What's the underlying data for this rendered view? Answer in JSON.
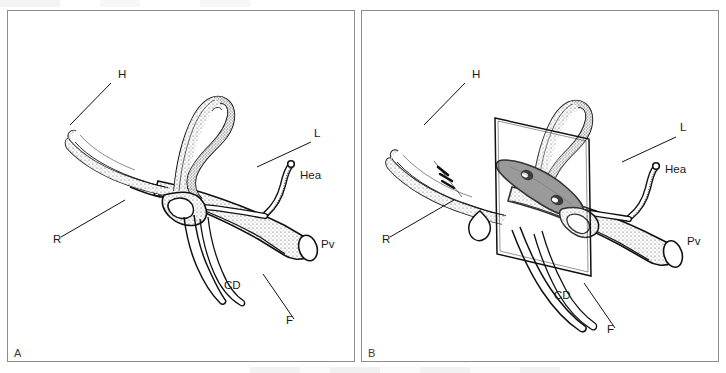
{
  "figure": {
    "background_color": "#ffffff",
    "frame_color": "#8d8d8d",
    "ink_color": "#111111",
    "panel_count": 2
  },
  "panels": [
    {
      "id": "A",
      "letter": "A",
      "caption": "",
      "has_cut_plane": false,
      "labels": [
        {
          "key": "H",
          "text": "H",
          "meaning": "hepatic duct",
          "x": 110,
          "y": 67,
          "leader": [
            [
              103,
              72
            ],
            [
              62,
              114
            ]
          ]
        },
        {
          "key": "L",
          "text": "L",
          "meaning": "left hepatic duct",
          "x": 306,
          "y": 126,
          "leader": [
            [
              303,
              131
            ],
            [
              249,
              156
            ]
          ]
        },
        {
          "key": "Hea",
          "text": "Hea",
          "meaning": "hepatic artery",
          "x": 292,
          "y": 168,
          "leader": []
        },
        {
          "key": "Pv",
          "text": "Pv",
          "meaning": "portal vein",
          "x": 313,
          "y": 237,
          "leader": []
        },
        {
          "key": "R",
          "text": "R",
          "meaning": "right hepatic duct",
          "x": 45,
          "y": 232,
          "leader": [
            [
              53,
              226
            ],
            [
              117,
              189
            ]
          ]
        },
        {
          "key": "CD",
          "text": "CD",
          "meaning": "cystic duct",
          "x": 216,
          "y": 278,
          "leader": []
        },
        {
          "key": "F",
          "text": "F",
          "meaning": "fissure / plate",
          "x": 278,
          "y": 313,
          "leader": [
            [
              286,
              308
            ],
            [
              255,
              263
            ]
          ]
        }
      ]
    },
    {
      "id": "B",
      "letter": "B",
      "caption": "",
      "has_cut_plane": true,
      "cut_plane": {
        "name": "sectioning-plane",
        "fill": "rgba(255,255,255,0.0)",
        "stroke": "#111111",
        "cut_surface_fill": "#8a8a8a",
        "lumen_fill": "#1a1a1a",
        "lumen_count": 2
      },
      "labels": [
        {
          "key": "H",
          "text": "H",
          "meaning": "hepatic duct",
          "x": 110,
          "y": 67,
          "leader": [
            [
              103,
              72
            ],
            [
              62,
              114
            ]
          ]
        },
        {
          "key": "L",
          "text": "L",
          "meaning": "left hepatic duct",
          "x": 318,
          "y": 120,
          "leader": [
            [
              314,
              126
            ],
            [
              260,
              151
            ]
          ]
        },
        {
          "key": "Hea",
          "text": "Hea",
          "meaning": "hepatic artery",
          "x": 303,
          "y": 162,
          "leader": []
        },
        {
          "key": "Pv",
          "text": "Pv",
          "meaning": "portal vein",
          "x": 325,
          "y": 234,
          "leader": []
        },
        {
          "key": "R",
          "text": "R",
          "meaning": "right hepatic duct",
          "x": 20,
          "y": 232,
          "leader": [
            [
              28,
              226
            ],
            [
              92,
              189
            ]
          ]
        },
        {
          "key": "CD",
          "text": "CD",
          "meaning": "cystic duct",
          "x": 192,
          "y": 288,
          "leader": []
        },
        {
          "key": "F",
          "text": "F",
          "meaning": "fissure / plate",
          "x": 245,
          "y": 322,
          "leader": [
            [
              253,
              317
            ],
            [
              222,
              272
            ]
          ]
        }
      ]
    }
  ],
  "legend_keys": [
    {
      "abbr": "H",
      "label": "H"
    },
    {
      "abbr": "L",
      "label": "L"
    },
    {
      "abbr": "R",
      "label": "R"
    },
    {
      "abbr": "Hea",
      "label": "Hea"
    },
    {
      "abbr": "Pv",
      "label": "Pv"
    },
    {
      "abbr": "CD",
      "label": "CD"
    },
    {
      "abbr": "F",
      "label": "F"
    }
  ]
}
